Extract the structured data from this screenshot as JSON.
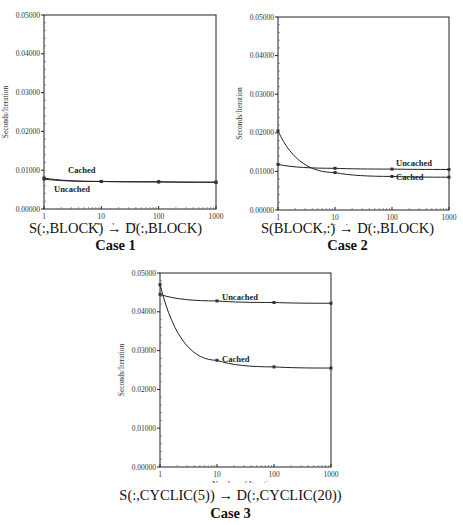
{
  "chart_data": [
    {
      "type": "line",
      "title": "S(:,BLOCK) → D(:,BLOCK)",
      "subtitle": "Case 1",
      "xlabel": "Number of Iterations",
      "ylabel": "Seconds/Iteration",
      "xscale": "log",
      "x": [
        1,
        10,
        100,
        1000
      ],
      "xticks": [
        "1",
        "10",
        "100",
        "1000"
      ],
      "yticks": [
        "0.00000",
        "0.01000",
        "0.02000",
        "0.03000",
        "0.04000",
        "0.05000"
      ],
      "ylim": [
        0,
        0.05
      ],
      "series": [
        {
          "name": "Cached",
          "values": [
            0.008,
            0.0071,
            0.007,
            0.0069
          ]
        },
        {
          "name": "Uncached",
          "values": [
            0.0077,
            0.0071,
            0.007,
            0.0069
          ]
        }
      ]
    },
    {
      "type": "line",
      "title": "S(BLOCK,:) → D(:,BLOCK)",
      "subtitle": "Case 2",
      "xlabel": "Number of Iterations",
      "ylabel": "Seconds/Iteration",
      "xscale": "log",
      "x": [
        1,
        10,
        100,
        1000
      ],
      "xticks": [
        "1",
        "10",
        "100",
        "1000"
      ],
      "yticks": [
        "0.00000",
        "0.01000",
        "0.02000",
        "0.03000",
        "0.04000",
        "0.05000"
      ],
      "ylim": [
        0,
        0.05
      ],
      "series": [
        {
          "name": "Uncached",
          "values": [
            0.0118,
            0.0108,
            0.0106,
            0.0105
          ]
        },
        {
          "name": "Cached",
          "values": [
            0.0205,
            0.0097,
            0.0087,
            0.0085
          ]
        }
      ]
    },
    {
      "type": "line",
      "title": "S(:,CYCLIC(5)) → D(:,CYCLIC(20))",
      "subtitle": "Case 3",
      "xlabel": "Number of Iterations",
      "ylabel": "Seconds/Iteration",
      "xscale": "log",
      "x": [
        1,
        10,
        100,
        1000
      ],
      "xticks": [
        "1",
        "10",
        "100",
        "1000"
      ],
      "yticks": [
        "0.00000",
        "0.01000",
        "0.02000",
        "0.03000",
        "0.04000",
        "0.05000"
      ],
      "ylim": [
        0,
        0.05
      ],
      "series": [
        {
          "name": "Uncached",
          "values": [
            0.0445,
            0.0428,
            0.0424,
            0.0422
          ]
        },
        {
          "name": "Cached",
          "values": [
            0.047,
            0.0275,
            0.0258,
            0.0255
          ]
        }
      ]
    }
  ]
}
